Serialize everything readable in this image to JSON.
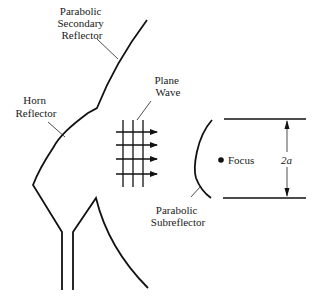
{
  "diagram": {
    "type": "antenna-geometry",
    "labels": {
      "secondary_reflector": [
        "Parabolic",
        "Secondary",
        "Reflector"
      ],
      "horn_reflector": [
        "Horn",
        "Reflector"
      ],
      "plane_wave": [
        "Plane",
        "Wave"
      ],
      "subreflector": [
        "Parabolic",
        "Subreflector"
      ],
      "focus": "Focus",
      "aperture_dimension": "2a"
    },
    "components": [
      {
        "id": "parabolic-secondary-reflector",
        "label": "Parabolic Secondary Reflector"
      },
      {
        "id": "horn-reflector",
        "label": "Horn Reflector"
      },
      {
        "id": "plane-wave",
        "label": "Plane Wave",
        "arrows": 4,
        "wavefronts": 3
      },
      {
        "id": "parabolic-subreflector",
        "label": "Parabolic Subreflector"
      },
      {
        "id": "focus-point",
        "label": "Focus"
      },
      {
        "id": "aperture-width",
        "label": "2a"
      }
    ],
    "colors": {
      "line": "#111111",
      "background": "#ffffff"
    }
  }
}
